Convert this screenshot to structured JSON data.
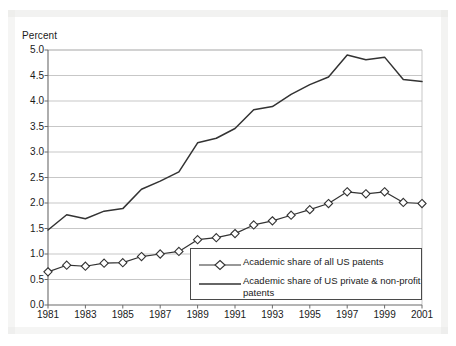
{
  "chart_data": {
    "type": "line",
    "title": "",
    "xlabel": "",
    "ylabel": "Percent",
    "ylim": [
      0.0,
      5.0
    ],
    "xlim": [
      1981,
      2001
    ],
    "grid": true,
    "legend_position": "inside-bottom-right",
    "ytick_labels": [
      "5.0",
      "4.5",
      "4.0",
      "3.5",
      "3.0",
      "2.5",
      "2.0",
      "1.5",
      "1.0",
      "0.5",
      "0.0"
    ],
    "ytick_values": [
      5.0,
      4.5,
      4.0,
      3.5,
      3.0,
      2.5,
      2.0,
      1.5,
      1.0,
      0.5,
      0.0
    ],
    "xtick_labels": [
      "1981",
      "1983",
      "1985",
      "1987",
      "1989",
      "1991",
      "1993",
      "1995",
      "1997",
      "1999",
      "2001"
    ],
    "xtick_values": [
      1981,
      1983,
      1985,
      1987,
      1989,
      1991,
      1993,
      1995,
      1997,
      1999,
      2001
    ],
    "x": [
      1981,
      1982,
      1983,
      1984,
      1985,
      1986,
      1987,
      1988,
      1989,
      1990,
      1991,
      1992,
      1993,
      1994,
      1995,
      1996,
      1997,
      1998,
      1999,
      2000,
      2001
    ],
    "series": [
      {
        "name": "Academic share of all US patents",
        "marker": "diamond-open",
        "color": "#333333",
        "values": [
          0.65,
          0.78,
          0.76,
          0.82,
          0.83,
          0.95,
          1.0,
          1.05,
          1.28,
          1.32,
          1.4,
          1.57,
          1.65,
          1.76,
          1.87,
          1.99,
          2.22,
          2.18,
          2.22,
          2.01,
          1.99
        ]
      },
      {
        "name": "Academic share of US private & non-profit patents",
        "marker": "none",
        "color": "#333333",
        "values": [
          1.47,
          1.77,
          1.69,
          1.84,
          1.89,
          2.27,
          2.43,
          2.61,
          3.18,
          3.27,
          3.46,
          3.83,
          3.89,
          4.13,
          4.32,
          4.47,
          4.9,
          4.81,
          4.86,
          4.42,
          4.38
        ]
      }
    ]
  },
  "legend": {
    "items": [
      {
        "label": "Academic share of all US patents",
        "key": "line-with-diamond-marker"
      },
      {
        "label": "Academic share of US private & non-profit\npatents",
        "key": "plain-line"
      }
    ]
  }
}
